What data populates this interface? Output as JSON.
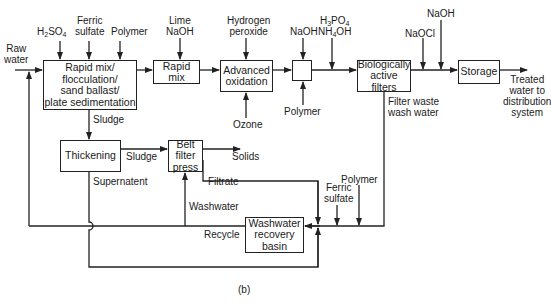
{
  "diagram": {
    "caption": "(b)",
    "inputs": {
      "raw_water": [
        "Raw",
        "water"
      ],
      "h2so4": {
        "base": "H",
        "sub1": "2",
        "mid": "SO",
        "sub2": "4"
      },
      "ferric_sulfate_top": [
        "Ferric",
        "sulfate"
      ],
      "polymer_top": "Polymer",
      "lime_naoh": [
        "Lime",
        "NaOH"
      ],
      "hydrogen_peroxide": [
        "Hydrogen",
        "peroxide"
      ],
      "naoh_1": "NaOH",
      "h3po4": {
        "base": "H",
        "sub1": "3",
        "mid": "PO",
        "sub2": "4"
      },
      "nh4oh": {
        "base": "NH",
        "sub1": "4",
        "mid": "OH"
      },
      "naocl": "NaOCl",
      "naoh_2": "NaOH",
      "ozone": "Ozone",
      "polymer_mid": "Polymer",
      "polymer_bottom": "Polymer",
      "ferric_sulfate_bottom": [
        "Ferric",
        "sulfate"
      ]
    },
    "process_units": [
      {
        "id": "rapid-mix-floc",
        "lines": [
          "Rapid mix/",
          "flocculation/",
          "sand ballast/",
          "plate sedimentation"
        ]
      },
      {
        "id": "rapid-mix",
        "lines": [
          "Rapid mix"
        ]
      },
      {
        "id": "advanced-oxidation",
        "lines": [
          "Advanced",
          "oxidation"
        ]
      },
      {
        "id": "small-mixer",
        "lines": [
          ""
        ]
      },
      {
        "id": "biological-filters",
        "lines": [
          "Biologically",
          "active filters"
        ]
      },
      {
        "id": "storage",
        "lines": [
          "Storage"
        ]
      },
      {
        "id": "thickening",
        "lines": [
          "Thickening"
        ]
      },
      {
        "id": "belt-filter-press",
        "lines": [
          "Belt filter",
          "press"
        ]
      },
      {
        "id": "washwater-recovery-basin",
        "lines": [
          "Washwater",
          "recovery",
          "basin"
        ]
      }
    ],
    "flow_labels": {
      "sludge_1": "Sludge",
      "sludge_2": "Sludge",
      "solids": "Solids",
      "supernatant": "Supernatent",
      "filtrate": "Filtrate",
      "washwater": "Washwater",
      "recycle": "Recycle",
      "filter_waste": [
        "Filter waste",
        "wash water"
      ],
      "treated_water": [
        "Treated",
        "water to",
        "distribution",
        "system"
      ]
    }
  }
}
